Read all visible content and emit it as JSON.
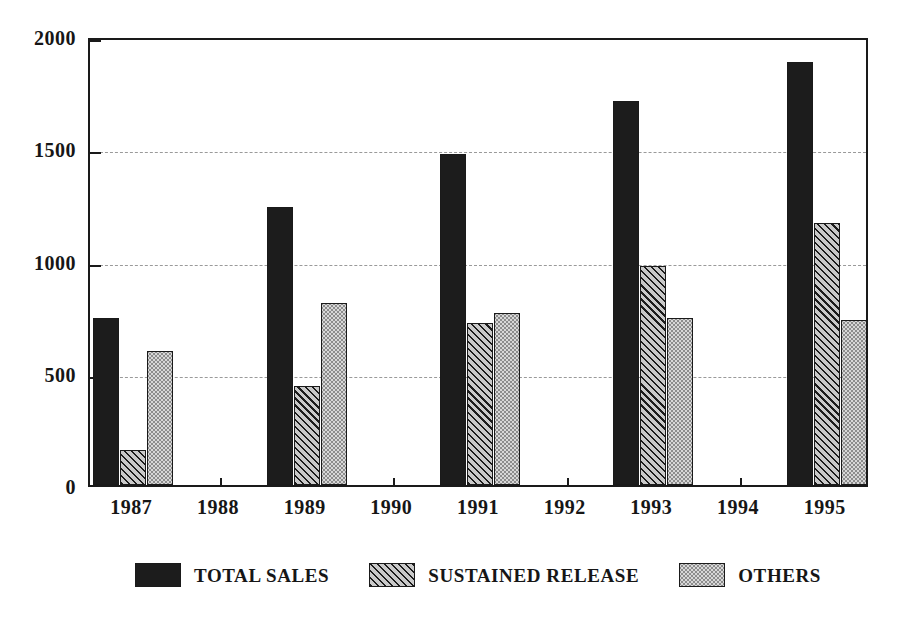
{
  "chart_data": {
    "type": "bar",
    "title": "",
    "subtitle": "",
    "xlabel": "",
    "ylabel": "",
    "ylim": [
      0,
      2000
    ],
    "yticks": [
      0,
      500,
      1000,
      1500,
      2000
    ],
    "ytick_labels": [
      "0",
      "500",
      "1000",
      "1500",
      "2000"
    ],
    "grid": true,
    "grid_axis": "y",
    "legend_position": "bottom",
    "categories": [
      "1987",
      "1988",
      "1989",
      "1990",
      "1991",
      "1992",
      "1993",
      "1994",
      "1995"
    ],
    "series": [
      {
        "name": "TOTAL SALES",
        "fill": "solid",
        "color": "#1c1c1c",
        "values": [
          744,
          null,
          1238,
          null,
          1474,
          null,
          1710,
          null,
          1884
        ]
      },
      {
        "name": "SUSTAINED RELEASE",
        "fill": "hatch",
        "color": "#c9c9c9",
        "values": [
          155,
          null,
          441,
          null,
          722,
          null,
          976,
          null,
          1167
        ]
      },
      {
        "name": "OTHERS",
        "fill": "dots",
        "color": "#d7d7d7",
        "values": [
          597,
          null,
          810,
          null,
          766,
          null,
          744,
          null,
          735
        ]
      }
    ]
  },
  "legend": {
    "items": [
      {
        "label": "TOTAL SALES",
        "fill": "solid"
      },
      {
        "label": "SUSTAINED RELEASE",
        "fill": "hatch"
      },
      {
        "label": "OTHERS",
        "fill": "dots"
      }
    ]
  },
  "axis": {
    "y_max_label": "2000",
    "y_min_label": "0"
  }
}
